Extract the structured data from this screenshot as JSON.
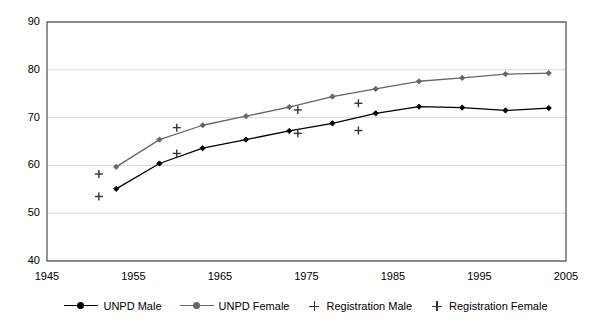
{
  "chart_data": {
    "type": "line",
    "title": "",
    "xlabel": "",
    "ylabel": "",
    "xlim": [
      1945,
      2005
    ],
    "ylim": [
      40,
      90
    ],
    "xticks": [
      1945,
      1955,
      1965,
      1975,
      1985,
      1995,
      2005
    ],
    "yticks": [
      40,
      50,
      60,
      70,
      80,
      90
    ],
    "grid": true,
    "legend_position": "bottom",
    "series": [
      {
        "name": "UNPD Male",
        "type": "line",
        "marker": "diamond",
        "color": "#000000",
        "x": [
          1953,
          1958,
          1963,
          1968,
          1973,
          1978,
          1983,
          1988,
          1993,
          1998,
          2003
        ],
        "values": [
          55.1,
          60.4,
          63.6,
          65.4,
          67.2,
          68.8,
          70.9,
          72.3,
          72.1,
          71.5,
          72.0
        ]
      },
      {
        "name": "UNPD Female",
        "type": "line",
        "marker": "diamond",
        "color": "#666666",
        "x": [
          1953,
          1958,
          1963,
          1968,
          1973,
          1978,
          1983,
          1988,
          1993,
          1998,
          2003
        ],
        "values": [
          59.7,
          65.4,
          68.4,
          70.3,
          72.2,
          74.4,
          76.0,
          77.6,
          78.3,
          79.1,
          79.3
        ]
      },
      {
        "name": "Registration Male",
        "type": "scatter",
        "marker": "plus",
        "color": "#333333",
        "x": [
          1951,
          1960,
          1974,
          1981
        ],
        "values": [
          53.5,
          62.5,
          66.7,
          67.3
        ]
      },
      {
        "name": "Registration Female",
        "type": "scatter",
        "marker": "plus",
        "color": "#333333",
        "x": [
          1951,
          1960,
          1974,
          1981
        ],
        "values": [
          58.2,
          67.9,
          71.6,
          73.0
        ]
      }
    ]
  },
  "axes": {
    "y_tick_labels": [
      "90",
      "80",
      "70",
      "60",
      "50",
      "40"
    ],
    "x_tick_labels": [
      "1945",
      "1955",
      "1965",
      "1975",
      "1985",
      "1995",
      "2005"
    ]
  },
  "legend": {
    "items": [
      {
        "label": "UNPD Male",
        "key": "line-diamond-marker",
        "color": "#000000"
      },
      {
        "label": "UNPD Female",
        "key": "line-diamond-marker",
        "color": "#666666"
      },
      {
        "label": "Registration Male",
        "key": "plus-marker",
        "color": "#333333"
      },
      {
        "label": "Registration Female",
        "key": "plus-marker",
        "color": "#333333"
      }
    ]
  },
  "colors": {
    "plot_border": "#4a4a4a",
    "gridline": "#d9d9d9",
    "background": "#ffffff"
  }
}
